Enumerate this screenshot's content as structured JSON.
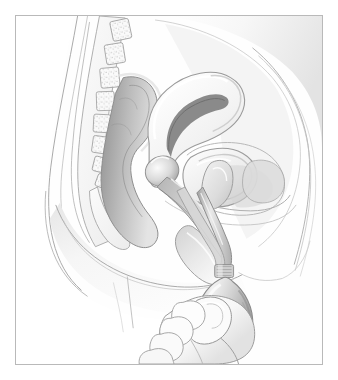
{
  "image": {
    "kind": "medical-illustration",
    "title": "Sagittal section of the female pelvis with handheld applicator bulb",
    "style": "grayscale pencil and airbrush anatomical drawing",
    "background_color": "#ffffff",
    "frame": {
      "border_color": "#b9b9b9",
      "border_width_px": 1,
      "inset_left_px": 15,
      "inset_top_px": 15,
      "width_px": 308,
      "height_px": 350,
      "fill_color": "#fefefe"
    },
    "palette": {
      "outline": "#8d8d8d",
      "outline_light": "#b5b5b5",
      "tissue_light": "#f4f4f4",
      "tissue_mid": "#dedede",
      "tissue_shadow": "#c4c4c4",
      "cavity_dark": "#9a9a9a",
      "cavity_darkest": "#7b7b7b",
      "device_body": "#cfcfcf",
      "device_highlight": "#f0f0f0",
      "device_shadow": "#a3a3a3",
      "skin_light": "#fafafa",
      "bone_stipple": "#9e9e9e"
    },
    "labels": [],
    "annotations": [],
    "text_present": false
  },
  "anatomy": {
    "structures": [
      {
        "id": "body-outline",
        "name": "Torso and thigh silhouette"
      },
      {
        "id": "abdominal-wall",
        "name": "Anterior abdominal wall layers"
      },
      {
        "id": "lumbar-spine",
        "name": "Lumbar vertebrae with trabecular stipple"
      },
      {
        "id": "sacrum",
        "name": "Sacrum and coccyx"
      },
      {
        "id": "rectum",
        "name": "Rectum and sigmoid colon"
      },
      {
        "id": "uterus",
        "name": "Uterus with endometrial cavity"
      },
      {
        "id": "cervix",
        "name": "Cervix"
      },
      {
        "id": "vagina",
        "name": "Vaginal canal"
      },
      {
        "id": "bladder",
        "name": "Urinary bladder"
      },
      {
        "id": "urethra",
        "name": "Urethra"
      },
      {
        "id": "pubic-bone",
        "name": "Pubic symphysis"
      },
      {
        "id": "perineum",
        "name": "Perineum and labia"
      },
      {
        "id": "gluteal",
        "name": "Gluteal and thigh soft tissue"
      }
    ]
  },
  "device": {
    "name": "Vaginal douche applicator bulb",
    "parts": [
      {
        "id": "nozzle",
        "name": "Insertion nozzle tip"
      },
      {
        "id": "tube",
        "name": "Flexible delivery tube"
      },
      {
        "id": "collar",
        "name": "Ribbed neck collar"
      },
      {
        "id": "bulb",
        "name": "Compressible pear-shaped bulb"
      }
    ]
  },
  "hand": {
    "name": "Hand gripping the bulb",
    "digits": [
      {
        "id": "thumb",
        "name": "Thumb across bulb"
      },
      {
        "id": "index",
        "name": "Index finger"
      },
      {
        "id": "middle",
        "name": "Middle finger"
      },
      {
        "id": "ring",
        "name": "Ring finger"
      },
      {
        "id": "little",
        "name": "Little finger"
      }
    ]
  }
}
